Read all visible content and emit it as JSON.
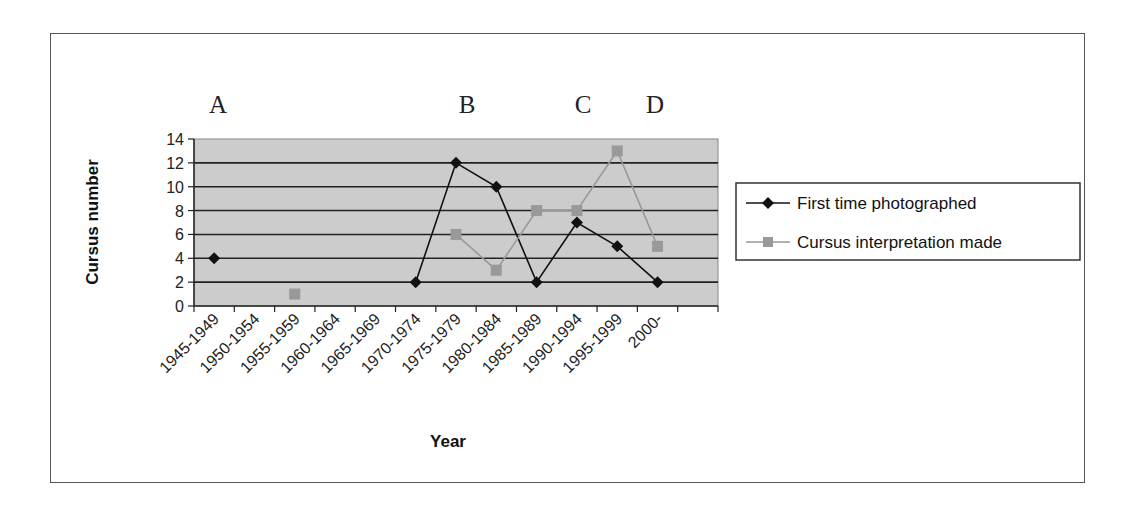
{
  "chart_data": {
    "type": "line",
    "title": "",
    "xlabel": "Year",
    "ylabel": "Cursus number",
    "ylim": [
      0,
      14
    ],
    "yticks": [
      0,
      2,
      4,
      6,
      8,
      10,
      12,
      14
    ],
    "grid": true,
    "legend_position": "right",
    "categories": [
      "1945-1949",
      "1950-1954",
      "1955-1959",
      "1960-1964",
      "1965-1969",
      "1970-1974",
      "1975-1979",
      "1980-1984",
      "1985-1989",
      "1990-1994",
      "1995-1999",
      "2000-"
    ],
    "series": [
      {
        "name": "First time photographed",
        "color": "#111111",
        "marker": "diamond",
        "values": [
          4,
          null,
          null,
          null,
          null,
          2,
          12,
          10,
          2,
          7,
          5,
          2
        ]
      },
      {
        "name": "Cursus interpretation made",
        "color": "#999999",
        "marker": "square",
        "values": [
          null,
          null,
          1,
          null,
          null,
          null,
          6,
          3,
          8,
          8,
          13,
          5
        ]
      }
    ],
    "annotations": [
      {
        "text": "A",
        "category": "1945-1949"
      },
      {
        "text": "B",
        "category": "1975-1979"
      },
      {
        "text": "C",
        "category": "1985-1989"
      },
      {
        "text": "D",
        "category": "1995-1999"
      }
    ],
    "plot_background": "#cccccc"
  }
}
